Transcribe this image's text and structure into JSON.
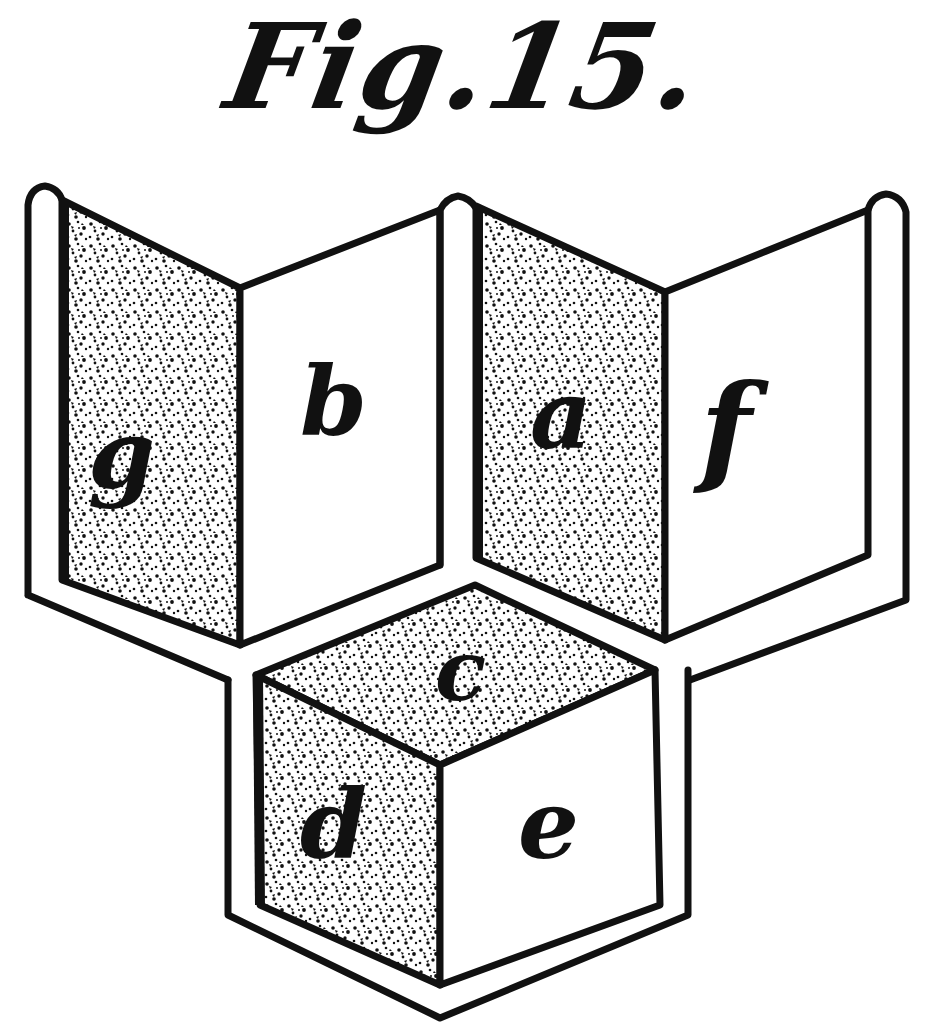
{
  "figure": {
    "title": "Fig.15.",
    "background_color": "#ffffff",
    "ink_color": "#111111"
  },
  "panels": {
    "g": {
      "label": "g",
      "shading": "stippled"
    },
    "b": {
      "label": "b",
      "shading": "plain"
    },
    "a": {
      "label": "a",
      "shading": "stippled"
    },
    "f": {
      "label": "f",
      "shading": "plain"
    },
    "c": {
      "label": "c",
      "shading": "stippled"
    },
    "d": {
      "label": "d",
      "shading": "stippled"
    },
    "e": {
      "label": "e",
      "shading": "plain"
    }
  }
}
